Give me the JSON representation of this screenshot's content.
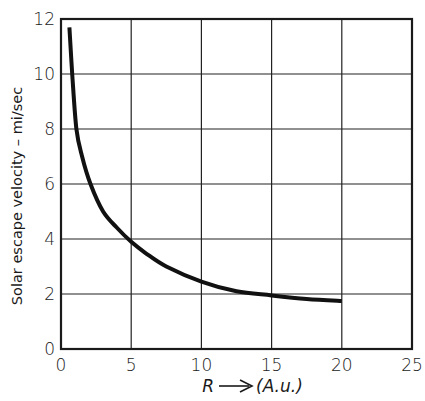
{
  "chart_data": {
    "type": "line",
    "title": "",
    "xlabel": "R → (A.u.)",
    "ylabel": "Solar escape velocity – mi/sec",
    "xlim": [
      0,
      25
    ],
    "ylim": [
      0,
      12
    ],
    "x_ticks": [
      "0",
      "5",
      "10",
      "15",
      "20",
      "25"
    ],
    "y_ticks": [
      "0",
      "2",
      "4",
      "6",
      "8",
      "10",
      "12"
    ],
    "grid": true,
    "legend": null,
    "series": [
      {
        "name": "Solar escape velocity",
        "x": [
          0.6,
          0.8,
          1.1,
          1.5,
          2.1,
          3.0,
          4.0,
          5.0,
          6.0,
          7.5,
          10.0,
          12.5,
          15.0,
          17.5,
          20.0
        ],
        "y": [
          11.7,
          10.0,
          8.0,
          7.0,
          6.0,
          5.0,
          4.4,
          3.9,
          3.5,
          3.0,
          2.45,
          2.1,
          1.95,
          1.82,
          1.75
        ]
      }
    ]
  },
  "labels": {
    "xlabel_r": "R",
    "xlabel_unit": "(A.u.)",
    "ylabel": "Solar escape velocity – mi/sec"
  },
  "colors": {
    "line": "#111111",
    "grid": "#222222",
    "background": "#ffffff"
  }
}
